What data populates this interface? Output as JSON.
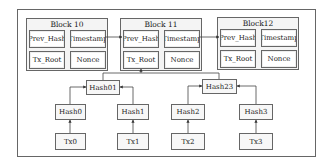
{
  "diagram": {
    "type": "blockchain-merkle-tree",
    "blocks": [
      {
        "title": "Block 10",
        "fields": [
          "Prev_Hash",
          "Timestamp",
          "Tx_Root",
          "Nonce"
        ]
      },
      {
        "title": "Block 11",
        "fields": [
          "Prev_Hash",
          "Timestamp",
          "Tx_Root",
          "Nonce"
        ]
      },
      {
        "title": "Block12",
        "fields": [
          "Prev_Hash",
          "Timestamp",
          "Tx_Root",
          "Nonce"
        ]
      }
    ],
    "merkle": {
      "level1": [
        "Hash01",
        "Hash23"
      ],
      "level2": [
        "Hash0",
        "Hash1",
        "Hash2",
        "Hash3"
      ],
      "transactions": [
        "Tx0",
        "Tx1",
        "Tx2",
        "Tx3"
      ]
    },
    "edges": [
      {
        "from": "Block 10.Timestamp",
        "to": "Block 11.Prev_Hash"
      },
      {
        "from": "Block 11.Timestamp",
        "to": "Block12.Prev_Hash"
      },
      {
        "from": "Hash01",
        "to": "Block 11.Tx_Root"
      },
      {
        "from": "Hash23",
        "to": "Block 11.Tx_Root"
      },
      {
        "from": "Hash0",
        "to": "Hash01"
      },
      {
        "from": "Hash1",
        "to": "Hash01"
      },
      {
        "from": "Hash2",
        "to": "Hash23"
      },
      {
        "from": "Hash3",
        "to": "Hash23"
      },
      {
        "from": "Tx0",
        "to": "Hash0"
      },
      {
        "from": "Tx1",
        "to": "Hash1"
      },
      {
        "from": "Tx2",
        "to": "Hash2"
      },
      {
        "from": "Tx3",
        "to": "Hash3"
      }
    ]
  }
}
